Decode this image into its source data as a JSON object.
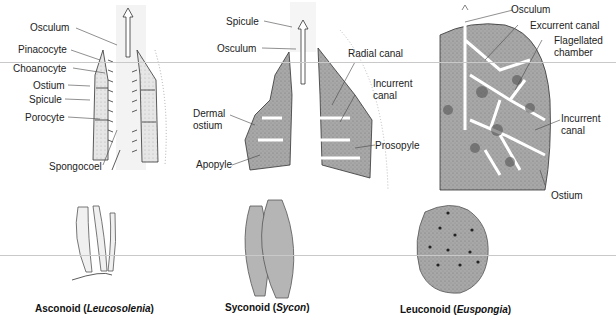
{
  "panels": [
    {
      "id": "asconoid",
      "labels": [
        "Osculum",
        "Pinacocyte",
        "Choanocyte",
        "Ostium",
        "Spicule",
        "Porocyte",
        "Spongocoel"
      ],
      "caption": {
        "type": "Asconoid",
        "genus": "Leucosolenia"
      }
    },
    {
      "id": "syconoid",
      "labels": [
        "Spicule",
        "Osculum",
        "Radial canal",
        "Incurrent",
        "canal",
        "Dermal",
        "ostium",
        "Apopyle",
        "Prosopyle"
      ],
      "caption": {
        "type": "Syconoid",
        "genus": "Sycon"
      }
    },
    {
      "id": "leuconoid",
      "labels": [
        "Osculum",
        "Excurrent canal",
        "Flagellated",
        "chamber",
        "Incurrent",
        "canal",
        "Ostium"
      ],
      "caption": {
        "type": "Leuconoid",
        "genus": "Euspongia"
      }
    }
  ],
  "colors": {
    "tissue": "#9c9c9c",
    "tissue_light": "#d8d8d8",
    "line": "#333333",
    "text": "#222222"
  }
}
